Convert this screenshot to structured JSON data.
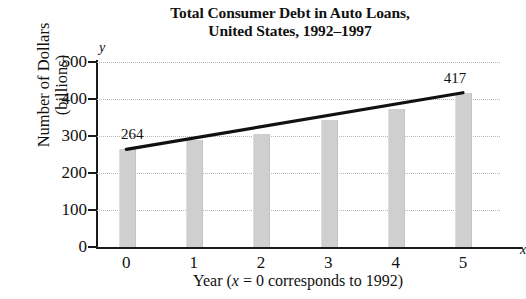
{
  "chart_data": {
    "type": "bar",
    "title": "Total Consumer Debt in Auto Loans, United States, 1992–1997",
    "title_lines": [
      "Total Consumer Debt in Auto Loans,",
      "United States, 1992–1997"
    ],
    "xlabel": "Year (x = 0 corresponds to 1992)",
    "xlabel_parts": {
      "prefix": "Year (",
      "variable": "x",
      "suffix": " = 0 corresponds to 1992)"
    },
    "ylabel": "Number of Dollars (billions)",
    "ylabel_lines": [
      "Number of Dollars",
      "(billions)"
    ],
    "x_variable": "x",
    "y_variable": "y",
    "categories": [
      "0",
      "1",
      "2",
      "3",
      "4",
      "5"
    ],
    "x": [
      0,
      1,
      2,
      3,
      4,
      5
    ],
    "values": [
      264,
      288,
      305,
      343,
      372,
      417
    ],
    "xlim": [
      -0.45,
      5.55
    ],
    "ylim": [
      0,
      500
    ],
    "yticks": [
      0,
      100,
      200,
      300,
      400,
      500
    ],
    "ytick_labels": [
      "0",
      "100",
      "200",
      "300",
      "400",
      "500"
    ],
    "xticks": [
      0,
      1,
      2,
      3,
      4,
      5
    ],
    "xtick_labels": [
      "0",
      "1",
      "2",
      "3",
      "4",
      "5"
    ],
    "grid": true,
    "grid_style": "dotted-horizontal",
    "legend": null,
    "bar_color": "#cfcfcf",
    "line_color": "#111111",
    "annotations": [
      {
        "label": "264",
        "x": 0,
        "y": 264
      },
      {
        "label": "417",
        "x": 5,
        "y": 417
      }
    ],
    "series": [
      {
        "name": "Total consumer debt in auto loans (billions of dollars)",
        "type": "bar",
        "values": [
          264,
          288,
          305,
          343,
          372,
          417
        ]
      },
      {
        "name": "Linear trend",
        "type": "line",
        "points": [
          {
            "x": 0,
            "y": 264
          },
          {
            "x": 5,
            "y": 417
          }
        ]
      }
    ]
  }
}
